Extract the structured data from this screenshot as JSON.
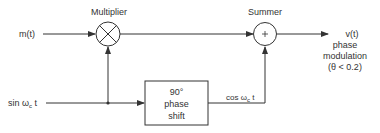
{
  "diagram": {
    "title_multiplier": "Multiplier",
    "title_summer": "Summer",
    "input_message": "m(t)",
    "input_carrier": "sin ω",
    "input_carrier_sub": "c",
    "input_carrier_t": "t",
    "phase_shift_box": {
      "line1": "90°",
      "line2": "phase",
      "line3": "shift"
    },
    "phase_shift_output": "cos ω",
    "phase_shift_output_sub": "c",
    "phase_shift_output_t": "t",
    "output": {
      "line1": "v(t)",
      "line2": "phase",
      "line3": "modulation",
      "line4": "(θ < 0.2)"
    },
    "multiplier_symbol": "×",
    "summer_symbol": "+",
    "colors": {
      "line": "#333333",
      "background": "#ffffff"
    }
  }
}
